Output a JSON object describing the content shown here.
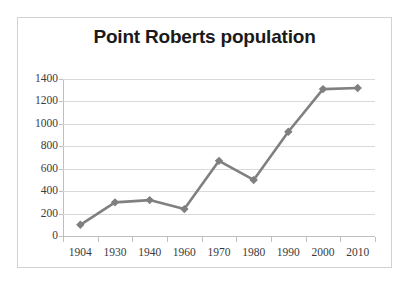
{
  "chart_data": {
    "type": "line",
    "title": "Point Roberts population",
    "xlabel": "",
    "ylabel": "",
    "categories": [
      "1904",
      "1930",
      "1940",
      "1960",
      "1970",
      "1980",
      "1990",
      "2000",
      "2010"
    ],
    "values": [
      100,
      300,
      320,
      240,
      670,
      500,
      930,
      1310,
      1320
    ],
    "series": [
      {
        "name": "Point Roberts population",
        "values": [
          100,
          300,
          320,
          240,
          670,
          500,
          930,
          1310,
          1320
        ]
      }
    ],
    "ylim": [
      0,
      1400
    ],
    "ytick_labels": [
      "1400",
      "1200",
      "1000",
      "800",
      "600",
      "400",
      "200",
      "0"
    ],
    "ytick_values": [
      1400,
      1200,
      1000,
      800,
      600,
      400,
      200,
      0
    ],
    "ytick_step": 200,
    "grid": true,
    "grid_axis": "y",
    "legend": false,
    "legend_position": "none",
    "marker": "diamond",
    "colors": {
      "series_line": "#808080",
      "series_marker": "#7f7f7f",
      "gridline": "#d9d9d9",
      "axis": "#bfbfbf",
      "frame_border": "#d2d2d2",
      "title_text": "#1a1a1a",
      "tick_text": "#3a3a3a",
      "plot_background": "#ffffff"
    }
  }
}
